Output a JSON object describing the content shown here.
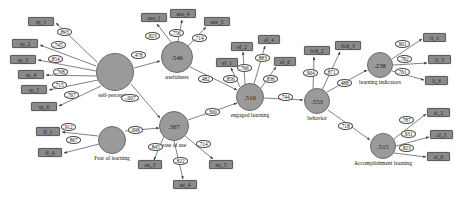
{
  "diagram": {
    "type": "structural-equation-model-path-diagram",
    "latents": [
      {
        "id": "self-perception",
        "label": "self-perception",
        "value": "",
        "cx": 115,
        "cy": 72,
        "r": 19
      },
      {
        "id": "fear-of-learning",
        "label": "Fear of learning",
        "value": "",
        "cx": 112,
        "cy": 140,
        "r": 14
      },
      {
        "id": "usefulness",
        "label": "usefulness",
        "value": ".546",
        "cx": 177,
        "cy": 57,
        "r": 16
      },
      {
        "id": "ease-of-use",
        "label": "ease of use",
        "value": ".367",
        "cx": 174,
        "cy": 126,
        "r": 15
      },
      {
        "id": "engaged-learning",
        "label": "engaged learning",
        "value": ".516",
        "cx": 250,
        "cy": 97,
        "r": 14
      },
      {
        "id": "behavior",
        "label": "behavior",
        "value": ".553",
        "cx": 317,
        "cy": 101,
        "r": 13
      },
      {
        "id": "learning-indicators",
        "label": "learning indicators",
        "value": ".238",
        "cx": 380,
        "cy": 65,
        "r": 13
      },
      {
        "id": "accomplishment-learning",
        "label": "Accomplishment learning",
        "value": ".515",
        "cx": 383,
        "cy": 146,
        "r": 13
      }
    ],
    "indicators": [
      {
        "id": "sp_1",
        "label": "sp_1",
        "x": 28,
        "y": 17,
        "w": 26
      },
      {
        "id": "sp_2",
        "label": "sp_2",
        "x": 12,
        "y": 39,
        "w": 26
      },
      {
        "id": "sp_3",
        "label": "sp_3",
        "x": 10,
        "y": 55,
        "w": 26
      },
      {
        "id": "sp_4",
        "label": "sp_4",
        "x": 18,
        "y": 70,
        "w": 26
      },
      {
        "id": "sp_5",
        "label": "sp_5",
        "x": 21,
        "y": 85,
        "w": 26
      },
      {
        "id": "sp_6",
        "label": "sp_6",
        "x": 31,
        "y": 102,
        "w": 26
      },
      {
        "id": "fl_1",
        "label": "fl_1",
        "x": 36,
        "y": 127,
        "w": 24
      },
      {
        "id": "fl_4",
        "label": "fl_4",
        "x": 38,
        "y": 148,
        "w": 24
      },
      {
        "id": "use_1",
        "label": "use_1",
        "x": 141,
        "y": 13,
        "w": 26
      },
      {
        "id": "use_4",
        "label": "use_4",
        "x": 170,
        "y": 9,
        "w": 26
      },
      {
        "id": "use_5",
        "label": "use_5",
        "x": 204,
        "y": 17,
        "w": 26
      },
      {
        "id": "ef_1",
        "label": "ef_1",
        "x": 216,
        "y": 58,
        "w": 22
      },
      {
        "id": "ef_2",
        "label": "ef_2",
        "x": 231,
        "y": 42,
        "w": 22
      },
      {
        "id": "ef_4",
        "label": "ef_4",
        "x": 258,
        "y": 35,
        "w": 22
      },
      {
        "id": "ef_6",
        "label": "ef_6",
        "x": 274,
        "y": 57,
        "w": 22
      },
      {
        "id": "eu_3",
        "label": "eu_3",
        "x": 138,
        "y": 160,
        "w": 24
      },
      {
        "id": "eu_4",
        "label": "eu_4",
        "x": 173,
        "y": 180,
        "w": 24
      },
      {
        "id": "eu_5",
        "label": "eu_5",
        "x": 209,
        "y": 160,
        "w": 24
      },
      {
        "id": "bch_2",
        "label": "bch_2",
        "x": 304,
        "y": 46,
        "w": 26
      },
      {
        "id": "bch_3",
        "label": "bch_3",
        "x": 335,
        "y": 41,
        "w": 26
      },
      {
        "id": "li_1",
        "label": "li_1",
        "x": 423,
        "y": 33,
        "w": 23
      },
      {
        "id": "li_3",
        "label": "li_3",
        "x": 428,
        "y": 55,
        "w": 23
      },
      {
        "id": "li_6",
        "label": "li_6",
        "x": 425,
        "y": 76,
        "w": 23
      },
      {
        "id": "al_2",
        "label": "al_2",
        "x": 427,
        "y": 108,
        "w": 23
      },
      {
        "id": "al_3",
        "label": "al_3",
        "x": 430,
        "y": 130,
        "w": 23
      },
      {
        "id": "al_6",
        "label": "al_6",
        "x": 427,
        "y": 152,
        "w": 23
      }
    ],
    "coefficients": [
      {
        "id": "c-sp1",
        "value": ".893",
        "x": 64,
        "y": 32
      },
      {
        "id": "c-sp2",
        "value": ".745",
        "x": 58,
        "y": 45
      },
      {
        "id": "c-sp3",
        "value": ".854",
        "x": 55,
        "y": 59
      },
      {
        "id": "c-sp4",
        "value": ".768",
        "x": 60,
        "y": 72
      },
      {
        "id": "c-sp5",
        "value": ".715",
        "x": 59,
        "y": 85
      },
      {
        "id": "c-sp6",
        "value": ".767",
        "x": 71,
        "y": 95
      },
      {
        "id": "c-fl1",
        "value": ".912",
        "x": 68,
        "y": 127
      },
      {
        "id": "c-fl4",
        "value": ".867",
        "x": 73,
        "y": 140
      },
      {
        "id": "c-sp-use",
        "value": ".478",
        "x": 138,
        "y": 55
      },
      {
        "id": "c-sp-eu",
        "value": "-.007",
        "x": 130,
        "y": 98
      },
      {
        "id": "c-fl-eu",
        "value": ".098",
        "x": 135,
        "y": 130
      },
      {
        "id": "c-use1",
        "value": ".823",
        "x": 152,
        "y": 36
      },
      {
        "id": "c-use4",
        "value": ".756",
        "x": 176,
        "y": 33
      },
      {
        "id": "c-use5",
        "value": ".714",
        "x": 199,
        "y": 38
      },
      {
        "id": "c-use-el",
        "value": ".482",
        "x": 205,
        "y": 79
      },
      {
        "id": "c-ef1",
        "value": ".856",
        "x": 230,
        "y": 79
      },
      {
        "id": "c-ef2",
        "value": ".766",
        "x": 244,
        "y": 68
      },
      {
        "id": "c-ef4",
        "value": ".883",
        "x": 262,
        "y": 58
      },
      {
        "id": "c-ef6",
        "value": ".836",
        "x": 270,
        "y": 79
      },
      {
        "id": "c-eu-el",
        "value": ".300",
        "x": 212,
        "y": 112
      },
      {
        "id": "c-eu3",
        "value": ".845",
        "x": 155,
        "y": 147
      },
      {
        "id": "c-eu4",
        "value": ".822",
        "x": 180,
        "y": 161
      },
      {
        "id": "c-eu5",
        "value": ".714",
        "x": 203,
        "y": 144
      },
      {
        "id": "c-el-bh",
        "value": ".744",
        "x": 285,
        "y": 97
      },
      {
        "id": "c-bch2",
        "value": ".904",
        "x": 310,
        "y": 73
      },
      {
        "id": "c-bch3",
        "value": ".871",
        "x": 331,
        "y": 72
      },
      {
        "id": "c-bh-li",
        "value": ".488",
        "x": 344,
        "y": 83
      },
      {
        "id": "c-bh-al",
        "value": ".718",
        "x": 345,
        "y": 126
      },
      {
        "id": "c-li1",
        "value": ".901",
        "x": 402,
        "y": 44
      },
      {
        "id": "c-li3",
        "value": ".782",
        "x": 404,
        "y": 59
      },
      {
        "id": "c-li6",
        "value": ".761",
        "x": 402,
        "y": 72
      },
      {
        "id": "c-al2",
        "value": ".787",
        "x": 406,
        "y": 120
      },
      {
        "id": "c-al3",
        "value": ".931",
        "x": 408,
        "y": 134
      },
      {
        "id": "c-al6",
        "value": ".823",
        "x": 406,
        "y": 148
      }
    ],
    "colors": {
      "node_fill": "#9a9a9a",
      "indicator_fill": "#8a8a8a",
      "stroke": "#555555",
      "background": "#ffffff"
    }
  }
}
